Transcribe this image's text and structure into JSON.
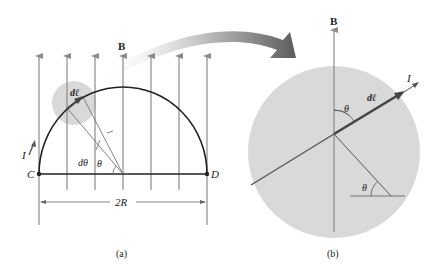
{
  "figure": {
    "panel_a": {
      "caption": "(a)",
      "field_label": "B",
      "current_label": "I",
      "element_label": "dℓ",
      "dtheta_label": "dθ",
      "theta_label": "θ",
      "left_point": "C",
      "right_point": "D",
      "dimension_label": "2R"
    },
    "panel_b": {
      "caption": "(b)",
      "field_label": "B",
      "current_label": "I",
      "element_label": "dℓ",
      "theta_top_label": "θ",
      "theta_bottom_label": "θ"
    },
    "colors": {
      "field_line": "#8a8a8a",
      "wire": "#222222",
      "highlight_disc": "#d9d9d9",
      "callout_arrow": "#6e6e6e"
    }
  }
}
